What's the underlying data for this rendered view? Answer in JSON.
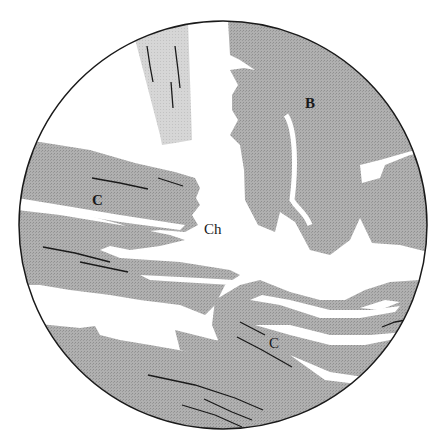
{
  "figure": {
    "type": "microscope-field-of-view diagram",
    "labels": {
      "B": "B",
      "C_upper": "C",
      "Ch": "Ch",
      "C_lower": "C"
    },
    "colors": {
      "background": "#ffffff",
      "tissue_dark": "#a9a9a9",
      "tissue_light": "#d2d2d2",
      "outline": "#1a1a1a"
    }
  }
}
